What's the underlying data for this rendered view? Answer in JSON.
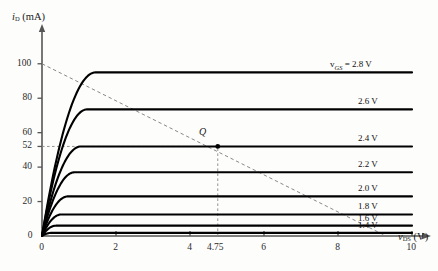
{
  "figure": {
    "y_axis_title": "i",
    "y_axis_sub": "D",
    "y_axis_unit": " (mA)",
    "x_axis_title": "v",
    "x_axis_sub": "DS",
    "x_axis_unit": " (V)",
    "q_point_label": "Q"
  },
  "axes": {
    "y_ticks": [
      "0",
      "20",
      "40",
      "52",
      "60",
      "80",
      "100"
    ],
    "x_ticks": [
      "0",
      "2",
      "4",
      "4.75",
      "6",
      "8",
      "10"
    ]
  },
  "curve_labels": [
    "v<sub>GS</sub> = 2.8 V",
    "2.6 V",
    "2.4 V",
    "2.2 V",
    "2.0 V",
    "1.8 V",
    "1.6 V",
    "1.4 V"
  ],
  "colors": {
    "curve": "#000000",
    "axis": "#555555",
    "loadline": "#888888",
    "qmarker": "#000000",
    "background": "#fdfdfc"
  },
  "chart_data": {
    "type": "line",
    "title": "",
    "xlabel": "v_DS (V)",
    "ylabel": "i_D (mA)",
    "xlim": [
      0,
      10
    ],
    "ylim": [
      0,
      108
    ],
    "xticks": [
      0,
      2,
      4,
      4.75,
      6,
      8,
      10
    ],
    "yticks": [
      0,
      20,
      40,
      52,
      60,
      80,
      100
    ],
    "grid": false,
    "legend": "right-inline",
    "series": [
      {
        "name": "v_GS = 2.8 V",
        "i_sat": 95,
        "v_knee": 1.45
      },
      {
        "name": "2.6 V",
        "i_sat": 73.5,
        "v_knee": 1.22
      },
      {
        "name": "2.4 V",
        "i_sat": 52,
        "v_knee": 1.05
      },
      {
        "name": "2.2 V",
        "i_sat": 37,
        "v_knee": 0.88
      },
      {
        "name": "2.0 V",
        "i_sat": 23,
        "v_knee": 0.7
      },
      {
        "name": "1.8 V",
        "i_sat": 12.5,
        "v_knee": 0.52
      },
      {
        "name": "1.6 V",
        "i_sat": 6,
        "v_knee": 0.38
      },
      {
        "name": "1.4 V",
        "i_sat": 1.8,
        "v_knee": 0.25
      }
    ],
    "load_line": {
      "from": [
        0,
        100
      ],
      "to": [
        9.3,
        0
      ],
      "style": "dashed"
    },
    "q_point": {
      "v_DS": 4.75,
      "i_D": 52,
      "label": "Q"
    },
    "q_guides": {
      "vertical": 4.75,
      "horizontal": 52,
      "style": "dashed"
    }
  }
}
